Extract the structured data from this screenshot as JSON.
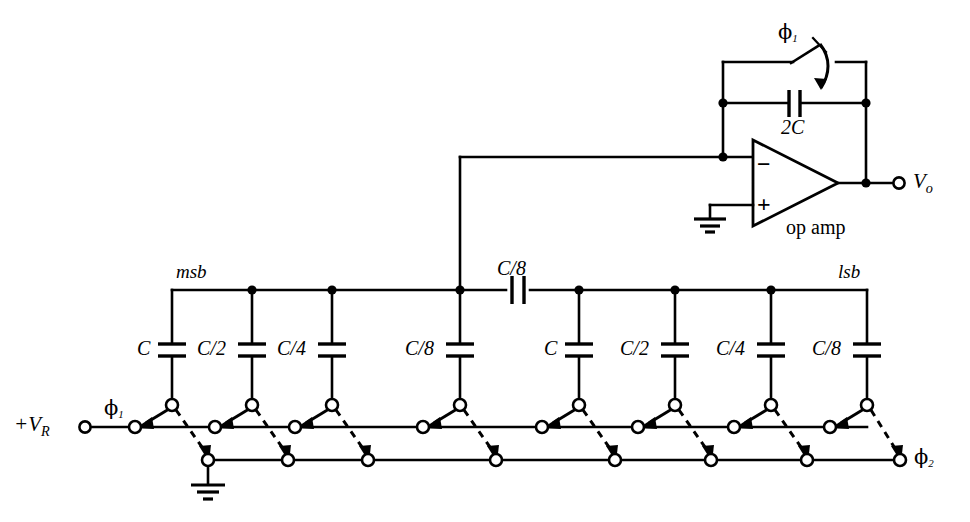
{
  "figure": {
    "type": "circuit-schematic",
    "width": 970,
    "height": 522,
    "background_color": "#ffffff",
    "line_color": "#000000"
  },
  "labels": {
    "input_terminal": "+V",
    "input_terminal_sub": "R",
    "output_terminal": "V",
    "output_terminal_sub": "o",
    "msb": "msb",
    "lsb": "lsb",
    "op_amp": "op amp",
    "feedback_cap": "2C",
    "coupling_cap": "C/8",
    "phi1_feedback": "ϕ",
    "phi1_feedback_sub": "1",
    "phi1_input": "ϕ",
    "phi1_input_sub": "1",
    "phi2_output": "ϕ",
    "phi2_output_sub": "2",
    "opamp_minus": "−",
    "opamp_plus": "+"
  },
  "capacitor_array": {
    "coupling_capacitor": "C/8",
    "left_bank_name": "msb",
    "right_bank_name": "lsb",
    "left_bank": [
      {
        "label": "C",
        "index": 0
      },
      {
        "label": "C/2",
        "index": 1
      },
      {
        "label": "C/4",
        "index": 2
      },
      {
        "label": "C/8",
        "index": 3
      }
    ],
    "right_bank": [
      {
        "label": "C",
        "index": 4
      },
      {
        "label": "C/2",
        "index": 5
      },
      {
        "label": "C/4",
        "index": 6
      },
      {
        "label": "C/8",
        "index": 7
      }
    ]
  },
  "feedback_network": {
    "capacitor": "2C",
    "switch_label": "ϕ",
    "switch_label_sub": "1"
  },
  "rails": {
    "top_rail_label_left": "msb",
    "top_rail_label_right": "lsb",
    "reference_rail": "+V",
    "reference_rail_sub": "R",
    "ground_rail_phase": "ϕ",
    "ground_rail_phase_sub": "2"
  },
  "switch_count": 8,
  "icons": {
    "ground": "ground-symbol",
    "capacitor": "capacitor-symbol",
    "opamp": "opamp-triangle",
    "switch": "spdt-switch",
    "terminal": "open-terminal-circle",
    "junction": "junction-dot"
  }
}
